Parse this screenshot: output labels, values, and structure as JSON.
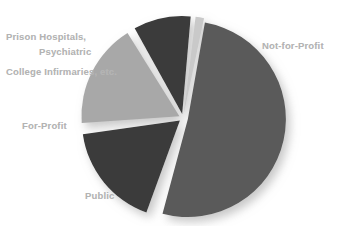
{
  "chart_data": {
    "type": "pie",
    "title": "",
    "subtitle": "",
    "xlabel": "",
    "ylabel": "",
    "legend_position": "none",
    "grid": false,
    "exploded": true,
    "labels_placement": "outside-left-and-right",
    "categories": [
      "Not-for-Profit",
      "Public",
      "For-Profit",
      "Psychiatric",
      "Prison Hospitals, College Infirmaries, etc."
    ],
    "values": [
      52,
      17,
      17,
      10,
      2
    ],
    "slices": [
      {
        "label": "Not-for-Profit",
        "value": 52,
        "color": "#5a5a5a",
        "start_angle": -80,
        "end_angle": 105,
        "explode": 5
      },
      {
        "label": "Public",
        "value": 17,
        "color": "#3a3a3a",
        "start_angle": 110,
        "end_angle": 172,
        "explode": 4
      },
      {
        "label": "For-Profit",
        "value": 17,
        "color": "#a8a8a8",
        "start_angle": 176,
        "end_angle": 238,
        "explode": 4
      },
      {
        "label": "Psychiatric",
        "value": 10,
        "color": "#3a3a3a",
        "start_angle": 241,
        "end_angle": 275,
        "explode": 4
      },
      {
        "label": "Prison Hospitals, College Infirmaries, etc.",
        "value": 2,
        "color": "#c9c9c9",
        "start_angle": 277,
        "end_angle": 282,
        "explode": 4
      }
    ],
    "geometry": {
      "center_x": 183,
      "center_y": 118,
      "radius": 98
    }
  },
  "labels": {
    "prison_line1": "Prison Hospitals,",
    "prison_line2": "College Infirmaries, etc.",
    "psychiatric": "Psychiatric",
    "for_profit": "For-Profit",
    "public": "Public",
    "not_for_profit": "Not-for-Profit"
  },
  "colors": {
    "background": "#ffffff",
    "label_text": "#b3b3b3",
    "dark_slice": "#3a3a3a",
    "medium_slice": "#5a5a5a",
    "light_slice": "#a8a8a8",
    "sliver_slice": "#c9c9c9",
    "shadow": "#cfcfcf"
  }
}
